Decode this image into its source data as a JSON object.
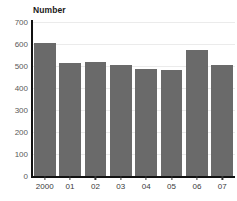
{
  "chart_data": {
    "type": "bar",
    "title": "",
    "xlabel": "",
    "ylabel": "Number",
    "categories": [
      "2000",
      "01",
      "02",
      "03",
      "04",
      "05",
      "06",
      "07"
    ],
    "values": [
      605,
      515,
      520,
      503,
      488,
      480,
      573,
      505
    ],
    "ylim": [
      0,
      700
    ],
    "yticks": [
      0,
      100,
      200,
      300,
      400,
      500,
      600,
      700
    ],
    "ytick_labels": [
      "0",
      "100",
      "200",
      "300",
      "400",
      "500",
      "600",
      "700"
    ],
    "grid": true,
    "legend": false,
    "series": [
      {
        "name": "Number",
        "values": [
          605,
          515,
          520,
          503,
          488,
          480,
          573,
          505
        ]
      }
    ],
    "colors": {
      "bar": "#6a6a6a",
      "gridline": "#ebebeb",
      "axis": "#111111",
      "tick_label": "#595959",
      "axis_title": "#1a1a1a"
    }
  },
  "chart": {
    "axis_title": "Number",
    "clipped_title": ""
  }
}
